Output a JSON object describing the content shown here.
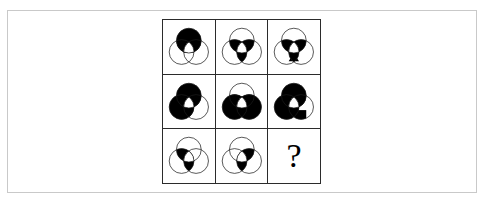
{
  "figure": {
    "type": "matrix-reasoning-puzzle",
    "grid_rows": 3,
    "grid_columns": 3,
    "border_color": "#2b2b2b",
    "frame_color": "#c9c9c9",
    "fill_color": "#000000",
    "background_color": "#ffffff",
    "stroke_color": "#1a1a1a"
  },
  "cells": [
    {
      "id": "cell-r1c1",
      "row": 1,
      "column": 1,
      "label": "row 1 column 1",
      "content_type": "venn-figure",
      "shaded_regions": [
        "top-only",
        "top-left-overlap",
        "top-right-overlap"
      ],
      "center_triangle": "white",
      "circles_outlined": [
        "top",
        "bottom-left",
        "bottom-right"
      ]
    },
    {
      "id": "cell-r1c2",
      "row": 1,
      "column": 2,
      "label": "row 1 column 2",
      "content_type": "venn-figure",
      "shaded_regions": [
        "top-left-overlap",
        "top-right-overlap",
        "bottom-left-right-overlap"
      ],
      "center_triangle": "white",
      "circles_outlined": [
        "top",
        "bottom-left",
        "bottom-right"
      ]
    },
    {
      "id": "cell-r1c3",
      "row": 1,
      "column": 3,
      "label": "row 1 column 3",
      "content_type": "venn-figure",
      "shaded_regions": [
        "top-left-overlap",
        "top-right-overlap",
        "bottom-left-right-overlap",
        "bottom-only"
      ],
      "center_triangle": "white",
      "circles_outlined": [
        "top",
        "bottom-left",
        "bottom-right"
      ]
    },
    {
      "id": "cell-r2c1",
      "row": 2,
      "column": 1,
      "label": "row 2 column 1",
      "content_type": "venn-figure",
      "shaded_regions": [
        "top-only",
        "bottom-left-only",
        "top-left-overlap",
        "top-right-overlap",
        "bottom-left-right-overlap"
      ],
      "center_triangle": "white",
      "circles_outlined": [
        "top",
        "bottom-left",
        "bottom-right"
      ]
    },
    {
      "id": "cell-r2c2",
      "row": 2,
      "column": 2,
      "label": "row 2 column 2",
      "content_type": "venn-figure",
      "shaded_regions": [
        "bottom-left-only",
        "bottom-right-only",
        "top-left-overlap",
        "top-right-overlap",
        "bottom-left-right-overlap"
      ],
      "center_triangle": "white",
      "circles_outlined": [
        "top",
        "bottom-left",
        "bottom-right"
      ]
    },
    {
      "id": "cell-r2c3",
      "row": 2,
      "column": 3,
      "label": "row 2 column 3",
      "content_type": "venn-figure",
      "shaded_regions": [
        "top-only",
        "bottom-left-only",
        "top-left-overlap",
        "top-right-overlap",
        "bottom-left-right-overlap",
        "bottom-extra"
      ],
      "center_triangle": "white",
      "circles_outlined": [
        "top",
        "bottom-left",
        "bottom-right"
      ]
    },
    {
      "id": "cell-r3c1",
      "row": 3,
      "column": 1,
      "label": "row 3 column 1",
      "content_type": "venn-figure",
      "shaded_regions": [
        "top-left-overlap",
        "bottom-left-right-overlap"
      ],
      "center_triangle": "white",
      "circles_outlined": [
        "top",
        "bottom-left",
        "bottom-right"
      ]
    },
    {
      "id": "cell-r3c2",
      "row": 3,
      "column": 2,
      "label": "row 3 column 2",
      "content_type": "venn-figure",
      "shaded_regions": [
        "top-right-overlap",
        "bottom-left-right-overlap"
      ],
      "center_triangle": "white",
      "circles_outlined": [
        "top",
        "bottom-left",
        "bottom-right"
      ]
    },
    {
      "id": "cell-r3c3",
      "row": 3,
      "column": 3,
      "label": "row 3 column 3 answer cell",
      "content_type": "question-mark",
      "text": "?"
    }
  ]
}
